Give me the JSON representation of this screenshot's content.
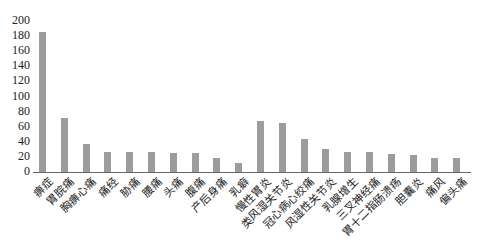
{
  "chart_data": {
    "type": "bar",
    "title": "",
    "xlabel": "",
    "ylabel": "",
    "ylim": [
      0,
      200
    ],
    "yticks": [
      0,
      20,
      40,
      60,
      80,
      100,
      120,
      140,
      160,
      180,
      200
    ],
    "grid": false,
    "legend": null,
    "bar_color": "#9c9c9c",
    "categories": [
      "痹症",
      "胃脘痛",
      "胸痹心痛",
      "痛经",
      "胁痛",
      "腰痛",
      "头痛",
      "腹痛",
      "产后身痛",
      "乳癖",
      "慢性胃炎",
      "类风湿关节炎",
      "冠心病心绞痛",
      "风湿性关节炎",
      "乳腺增生",
      "三叉神经痛",
      "胃十二指肠溃疡",
      "胆囊炎",
      "痛风",
      "偏头痛"
    ],
    "values": [
      185,
      71,
      37,
      27,
      26,
      26,
      25,
      25,
      18,
      12,
      68,
      65,
      44,
      30,
      26,
      26,
      24,
      22,
      18,
      18
    ]
  }
}
